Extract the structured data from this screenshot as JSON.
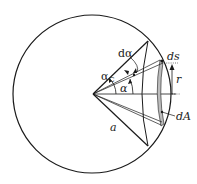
{
  "diagram": {
    "labels": {
      "d_alpha": "dα",
      "alpha_c": "α",
      "alpha_c_sub": "C",
      "alpha": "α",
      "ds": "ds",
      "r": "r",
      "dA": "dA",
      "a": "a"
    },
    "colors": {
      "stroke": "#1a1a1a",
      "ring_fill": "#bdbdbd",
      "background": "#ffffff"
    }
  }
}
